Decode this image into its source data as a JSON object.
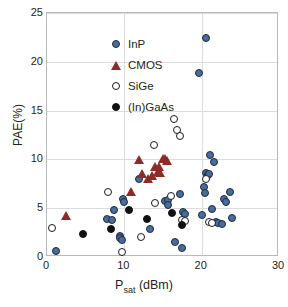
{
  "chart_data": {
    "type": "scatter",
    "title": "",
    "xlabel": "Psat (dBm)",
    "xlabel_base": "P",
    "xlabel_sub": "sat",
    "xlabel_unit": " (dBm)",
    "ylabel": "PAE(%)",
    "xlim": [
      0,
      30
    ],
    "ylim": [
      0,
      25
    ],
    "xticks": [
      0,
      10,
      20,
      30
    ],
    "yticks": [
      0,
      5,
      10,
      15,
      20,
      25
    ],
    "grid": true,
    "legend_position": "top-left",
    "series": [
      {
        "name": "InP",
        "marker": "filled-circle",
        "color": "#4a6c97",
        "edge_color": "#1b2b44",
        "points": [
          [
            1.1,
            0.6
          ],
          [
            7.8,
            3.9
          ],
          [
            8.4,
            3.8
          ],
          [
            8.6,
            4.8
          ],
          [
            9.4,
            2.2
          ],
          [
            9.5,
            1.9
          ],
          [
            9.7,
            1.7
          ],
          [
            9.8,
            5.9
          ],
          [
            9.9,
            5.6
          ],
          [
            11.9,
            8.0
          ],
          [
            13.3,
            2.9
          ],
          [
            15.3,
            5.7
          ],
          [
            15.6,
            5.8
          ],
          [
            15.7,
            5.3
          ],
          [
            16.6,
            1.5
          ],
          [
            17.2,
            6.5
          ],
          [
            17.4,
            0.9
          ],
          [
            17.6,
            4.6
          ],
          [
            17.9,
            4.4
          ],
          [
            19.6,
            18.9
          ],
          [
            20.0,
            4.3
          ],
          [
            20.3,
            7.2
          ],
          [
            20.4,
            6.6
          ],
          [
            20.5,
            22.4
          ],
          [
            20.6,
            8.6
          ],
          [
            20.8,
            8.4
          ],
          [
            21.0,
            8.5
          ],
          [
            21.1,
            10.4
          ],
          [
            21.3,
            4.9
          ],
          [
            21.6,
            9.7
          ],
          [
            21.9,
            3.6
          ],
          [
            22.1,
            3.5
          ],
          [
            22.6,
            3.4
          ],
          [
            22.9,
            5.9
          ],
          [
            23.1,
            5.6
          ],
          [
            23.6,
            6.7
          ],
          [
            23.9,
            4.0
          ]
        ]
      },
      {
        "name": "CMOS",
        "marker": "filled-triangle",
        "color": "#8e2b29",
        "points": [
          [
            2.4,
            4.3
          ],
          [
            10.8,
            6.8
          ],
          [
            11.9,
            10.0
          ],
          [
            12.3,
            8.6
          ],
          [
            13.0,
            8.1
          ],
          [
            13.6,
            8.4
          ],
          [
            14.0,
            9.3
          ],
          [
            14.3,
            8.8
          ],
          [
            14.5,
            9.3
          ],
          [
            14.6,
            8.7
          ],
          [
            15.0,
            10.1
          ],
          [
            15.3,
            10.1
          ],
          [
            15.5,
            9.9
          ]
        ]
      },
      {
        "name": "SiGe",
        "marker": "open-circle",
        "color": "#ffffff",
        "edge_color": "#1a1a1a",
        "points": [
          [
            0.6,
            3.0
          ],
          [
            7.9,
            6.7
          ],
          [
            9.7,
            0.5
          ],
          [
            12.1,
            2.0
          ],
          [
            13.9,
            11.5
          ],
          [
            14.0,
            5.5
          ],
          [
            16.0,
            6.2
          ],
          [
            16.4,
            14.1
          ],
          [
            16.8,
            13.0
          ],
          [
            17.2,
            12.4
          ],
          [
            17.5,
            3.8
          ],
          [
            17.8,
            3.7
          ],
          [
            20.5,
            8.0
          ],
          [
            21.0,
            3.6
          ],
          [
            21.4,
            3.5
          ]
        ]
      },
      {
        "name": "(In)GaAs",
        "marker": "filled-circle",
        "color": "#111111",
        "points": [
          [
            4.6,
            2.4
          ],
          [
            8.3,
            2.9
          ],
          [
            10.6,
            4.8
          ],
          [
            12.9,
            3.9
          ],
          [
            16.2,
            4.5
          ],
          [
            17.4,
            3.3
          ]
        ]
      }
    ]
  },
  "legend": {
    "items": [
      {
        "label": "InP",
        "icon": "filled-circle-blue-icon"
      },
      {
        "label": "CMOS",
        "icon": "filled-triangle-red-icon"
      },
      {
        "label": "SiGe",
        "icon": "open-circle-icon"
      },
      {
        "label": "(In)GaAs",
        "icon": "filled-circle-black-icon"
      }
    ]
  }
}
